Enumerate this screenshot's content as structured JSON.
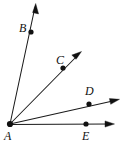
{
  "figure": {
    "background_color": "#ffffff",
    "line_color": "#1a1a1a",
    "dot_color": "#111111",
    "label_color": "#111111",
    "vertex": {
      "name": "A",
      "label": "A",
      "x": 10,
      "y": 124,
      "label_x": 5,
      "label_y": 131
    },
    "rays": [
      {
        "id": "ray-ab",
        "label": "B",
        "point_label": "B",
        "point_x": 31,
        "point_y": 32,
        "label_x": 19,
        "label_y": 22,
        "tip_x": 35,
        "tip_y": 5,
        "arrow": "true"
      },
      {
        "id": "ray-ac",
        "label": "C",
        "point_label": "C",
        "point_x": 63,
        "point_y": 68,
        "label_x": 56,
        "label_y": 54,
        "tip_x": 81,
        "tip_y": 52,
        "arrow": "true"
      },
      {
        "id": "ray-ad",
        "label": "D",
        "point_label": "D",
        "point_x": 89,
        "point_y": 104,
        "label_x": 85,
        "label_y": 85,
        "tip_x": 119,
        "tip_y": 99,
        "arrow": "true"
      },
      {
        "id": "ray-ae",
        "label": "E",
        "point_label": "E",
        "point_x": 86,
        "point_y": 124,
        "label_x": 82,
        "label_y": 130,
        "tip_x": 114,
        "tip_y": 124,
        "arrow": "true"
      }
    ]
  }
}
